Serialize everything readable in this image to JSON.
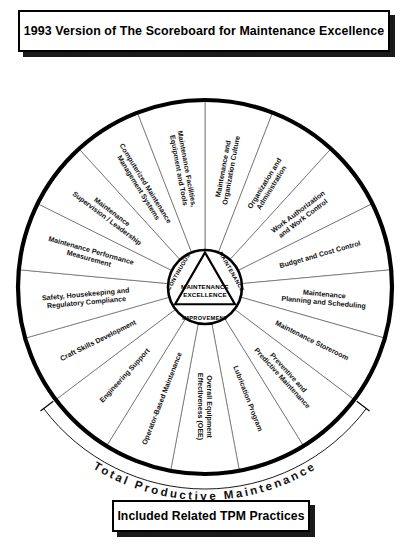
{
  "title_box": {
    "label": "1993 Version of The Scoreboard for Maintenance Excellence"
  },
  "footer_box": {
    "label": "Included Related TPM Practices"
  },
  "outer_arc": {
    "label": "Total Productive Maintenance"
  },
  "hub": {
    "top_left_label": "CONTINUOUS",
    "top_right_label": "MAINTENANCE",
    "bottom_label": "IMPROVEMENT",
    "center_line1": "MAINTENANCE",
    "center_line2": "EXCELLENCE"
  },
  "colors": {
    "ink": "#000000",
    "paper": "#ffffff",
    "shadow": "#1a1a1a",
    "hairline": "#555555"
  },
  "wheel": {
    "segment_count": 17,
    "segments": [
      {
        "index": 0,
        "lines": [
          "Maintenance and",
          "Organization Culture"
        ]
      },
      {
        "index": 1,
        "lines": [
          "Organization and",
          "Administration"
        ]
      },
      {
        "index": 2,
        "lines": [
          "Work Authorization",
          "and Work Control"
        ]
      },
      {
        "index": 3,
        "lines": [
          "Budget and Cost Control"
        ]
      },
      {
        "index": 4,
        "lines": [
          "Maintenance",
          "Planning and Scheduling"
        ]
      },
      {
        "index": 5,
        "lines": [
          "Maintenance Storeroom"
        ]
      },
      {
        "index": 6,
        "lines": [
          "Preventive and",
          "Predictive Maintenance"
        ]
      },
      {
        "index": 7,
        "lines": [
          "Lubrication Program"
        ]
      },
      {
        "index": 8,
        "lines": [
          "Overall Equipment",
          "Effectiveness (OEE)"
        ]
      },
      {
        "index": 9,
        "lines": [
          "Operator-Based Maintenance"
        ]
      },
      {
        "index": 10,
        "lines": [
          "Engineering Support"
        ]
      },
      {
        "index": 11,
        "lines": [
          "Craft Skills Development"
        ]
      },
      {
        "index": 12,
        "lines": [
          "Safety, Housekeeping and",
          "Regulatory Compliance"
        ]
      },
      {
        "index": 13,
        "lines": [
          "Maintenance Performance",
          "Measurement"
        ]
      },
      {
        "index": 14,
        "lines": [
          "Maintenance",
          "Supervision / Leadership"
        ]
      },
      {
        "index": 15,
        "lines": [
          "Computerized Maintenance",
          "Management Systems"
        ]
      },
      {
        "index": 16,
        "lines": [
          "Maintenance Facilities,",
          "Equipment and Tools"
        ]
      }
    ]
  }
}
